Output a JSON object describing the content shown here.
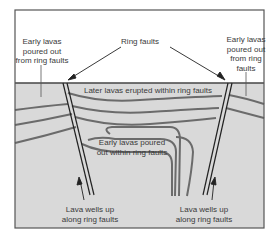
{
  "diagram": {
    "type": "geologic-cross-section",
    "colors": {
      "sky": "#ffffff",
      "ground": "#d9d9d9",
      "frame": "#555555",
      "lava_line": "#6b6b6b",
      "fault_line": "#222222",
      "text": "#3a3a3a"
    },
    "labels": {
      "left_top": [
        "Early lavas",
        "poured out",
        "from ring faults"
      ],
      "center_top": "Ring faults",
      "right_top": [
        "Early lavas",
        "poured out",
        "from ring",
        "faults"
      ],
      "later_lavas": "Later lavas erupted within ring faults",
      "early_within": [
        "Early lavas poured",
        "out within ring faults"
      ],
      "left_bottom": [
        "Lava wells up",
        "along ring faults"
      ],
      "right_bottom": [
        "Lava wells up",
        "along ring faults"
      ]
    }
  }
}
